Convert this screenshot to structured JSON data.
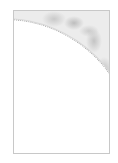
{
  "thumbnail": {
    "description": "texture swatch with circular white cut-out",
    "colors": {
      "frame_border": "#c8c8c8",
      "texture_base": "#ececec",
      "texture_dark": "#bdbdbd",
      "cutout": "#ffffff"
    }
  }
}
